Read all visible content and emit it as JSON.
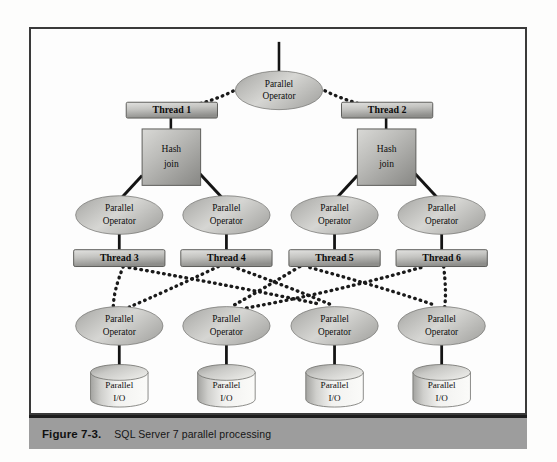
{
  "figure": {
    "caption_label": "Figure 7-3.",
    "caption_text": "SQL Server 7 parallel processing",
    "border_color": "#3a3a3a",
    "caption_bg": "#9d9d9d",
    "page_bg": "#ffffff"
  },
  "diagram": {
    "type": "tree-diagram",
    "root": {
      "id": "root-operator",
      "label_line1": "Parallel",
      "label_line2": "Operator",
      "shape": "ellipse",
      "cx": 279,
      "cy": 72,
      "rx": 42,
      "ry": 19,
      "stem_top": 40
    },
    "threads_top": [
      {
        "id": "thread-1",
        "label": "Thread 1",
        "x": 125,
        "y": 101,
        "w": 90,
        "h": 16
      },
      {
        "id": "thread-2",
        "label": "Thread 2",
        "x": 342,
        "y": 101,
        "w": 90,
        "h": 16
      }
    ],
    "hash_joins": [
      {
        "id": "hash-join-1",
        "label_line1": "Hash",
        "label_line2": "join",
        "x": 141,
        "y": 128,
        "w": 58,
        "h": 56
      },
      {
        "id": "hash-join-2",
        "label_line1": "Hash",
        "label_line2": "join",
        "x": 358,
        "y": 128,
        "w": 58,
        "h": 56
      }
    ],
    "operators_mid": [
      {
        "id": "operator-mid-1",
        "label_line1": "Parallel",
        "label_line2": "Operator",
        "cx": 118,
        "cy": 215,
        "rx": 42,
        "ry": 19
      },
      {
        "id": "operator-mid-2",
        "label_line1": "Parallel",
        "label_line2": "Operator",
        "cx": 226,
        "cy": 215,
        "rx": 42,
        "ry": 19
      },
      {
        "id": "operator-mid-3",
        "label_line1": "Parallel",
        "label_line2": "Operator",
        "cx": 335,
        "cy": 215,
        "rx": 42,
        "ry": 19
      },
      {
        "id": "operator-mid-4",
        "label_line1": "Parallel",
        "label_line2": "Operator",
        "cx": 443,
        "cy": 215,
        "rx": 42,
        "ry": 19
      }
    ],
    "threads_bottom": [
      {
        "id": "thread-3",
        "label": "Thread 3",
        "x": 73,
        "y": 250,
        "w": 90,
        "h": 16
      },
      {
        "id": "thread-4",
        "label": "Thread 4",
        "x": 181,
        "y": 250,
        "w": 90,
        "h": 16
      },
      {
        "id": "thread-5",
        "label": "Thread 5",
        "x": 290,
        "y": 250,
        "w": 90,
        "h": 16
      },
      {
        "id": "thread-6",
        "label": "Thread 6",
        "x": 398,
        "y": 250,
        "w": 90,
        "h": 16
      }
    ],
    "operators_bottom": [
      {
        "id": "operator-bottom-1",
        "label_line1": "Parallel",
        "label_line2": "Operator",
        "cx": 118,
        "cy": 327,
        "rx": 42,
        "ry": 19
      },
      {
        "id": "operator-bottom-2",
        "label_line1": "Parallel",
        "label_line2": "Operator",
        "cx": 226,
        "cy": 327,
        "rx": 42,
        "ry": 19
      },
      {
        "id": "operator-bottom-3",
        "label_line1": "Parallel",
        "label_line2": "Operator",
        "cx": 335,
        "cy": 327,
        "rx": 42,
        "ry": 19
      },
      {
        "id": "operator-bottom-4",
        "label_line1": "Parallel",
        "label_line2": "Operator",
        "cx": 443,
        "cy": 327,
        "rx": 42,
        "ry": 19
      }
    ],
    "io_nodes": [
      {
        "id": "parallel-io-1",
        "label_line1": "Parallel",
        "label_line2": "I/O",
        "cx": 118,
        "cy": 385,
        "rx": 29,
        "ry": 8,
        "h": 34
      },
      {
        "id": "parallel-io-2",
        "label_line1": "Parallel",
        "label_line2": "I/O",
        "cx": 226,
        "cy": 385,
        "rx": 29,
        "ry": 8,
        "h": 34
      },
      {
        "id": "parallel-io-3",
        "label_line1": "Parallel",
        "label_line2": "I/O",
        "cx": 335,
        "cy": 385,
        "rx": 29,
        "ry": 8,
        "h": 34
      },
      {
        "id": "parallel-io-4",
        "label_line1": "Parallel",
        "label_line2": "I/O",
        "cx": 443,
        "cy": 385,
        "rx": 29,
        "ry": 8,
        "h": 34
      }
    ],
    "edges_dotted_top": [
      {
        "from": "root-operator",
        "to": "thread-1",
        "path": "M 243 82 Q 210 98 170 101"
      },
      {
        "from": "root-operator",
        "to": "thread-2",
        "path": "M 315 82 Q 350 98 387 101"
      }
    ],
    "edges_solid": [
      {
        "from": "thread-1",
        "to": "hash-join-1",
        "path": "M 170 117 L 170 128"
      },
      {
        "from": "thread-2",
        "to": "hash-join-2",
        "path": "M 387 117 L 387 128"
      },
      {
        "from": "hash-join-1",
        "to": "operator-mid-1",
        "path": "M 141 175 L 118 198"
      },
      {
        "from": "hash-join-1",
        "to": "operator-mid-2",
        "path": "M 199 173 L 222 198"
      },
      {
        "from": "hash-join-2",
        "to": "operator-mid-3",
        "path": "M 358 175 L 335 198"
      },
      {
        "from": "hash-join-2",
        "to": "operator-mid-4",
        "path": "M 416 173 L 439 198"
      },
      {
        "from": "operator-mid-1",
        "to": "thread-3",
        "path": "M 118 234 L 118 250"
      },
      {
        "from": "operator-mid-2",
        "to": "thread-4",
        "path": "M 226 234 L 226 250"
      },
      {
        "from": "operator-mid-3",
        "to": "thread-5",
        "path": "M 335 234 L 335 250"
      },
      {
        "from": "operator-mid-4",
        "to": "thread-6",
        "path": "M 443 234 L 443 250"
      },
      {
        "from": "operator-bottom-1",
        "to": "parallel-io-1",
        "path": "M 118 346 L 118 368"
      },
      {
        "from": "operator-bottom-2",
        "to": "parallel-io-2",
        "path": "M 226 346 L 226 368"
      },
      {
        "from": "operator-bottom-3",
        "to": "parallel-io-3",
        "path": "M 335 346 L 335 368"
      },
      {
        "from": "operator-bottom-4",
        "to": "parallel-io-4",
        "path": "M 443 346 L 443 368"
      }
    ],
    "edges_dotted_mesh": [
      {
        "from": "thread-3",
        "to": "operator-bottom-1",
        "path": "M 122 266 Q 112 292 112 308"
      },
      {
        "from": "thread-3",
        "to": "operator-bottom-3",
        "path": "M 128 268 Q 240 288 320 305"
      },
      {
        "from": "thread-4",
        "to": "operator-bottom-1",
        "path": "M 218 267 Q 165 292 128 308"
      },
      {
        "from": "thread-4",
        "to": "operator-bottom-3",
        "path": "M 232 267 Q 290 288 330 305"
      },
      {
        "from": "thread-5",
        "to": "operator-bottom-2",
        "path": "M 300 267 Q 262 290 232 307"
      },
      {
        "from": "thread-5",
        "to": "operator-bottom-4",
        "path": "M 310 268 Q 390 290 436 306"
      },
      {
        "from": "thread-6",
        "to": "operator-bottom-2",
        "path": "M 422 268 Q 330 294 240 310"
      },
      {
        "from": "thread-6",
        "to": "operator-bottom-4",
        "path": "M 445 267 Q 448 292 446 308"
      }
    ],
    "colors": {
      "node_fill_light": "#dcdcda",
      "node_fill_mid": "#b4b4b1",
      "node_fill_dark": "#8f8f8c",
      "line": "#141414",
      "stroke": "#55555",
      "text": "#0d0d0d"
    }
  }
}
